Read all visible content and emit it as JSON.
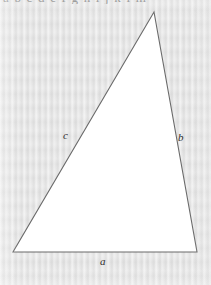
{
  "figure": {
    "kind": "geometry-diagram",
    "caption_fragment_top": "a b c d e f g h i j k l m",
    "background_color": "#e7e7e7",
    "shape_fill": "#ffffff",
    "stroke_color": "#6a6a6a",
    "label_color": "#2e2e2e"
  },
  "labels": {
    "side_a": "a",
    "side_b": "b",
    "side_c": "c"
  },
  "chart_data": {
    "type": "scatter",
    "title": "",
    "xlabel": "",
    "ylabel": "",
    "grid": false,
    "legend": "none",
    "xlim": [
      0,
      211
    ],
    "ylim": [
      285,
      0
    ],
    "annotations": [
      {
        "text": "c",
        "x": 70,
        "y": 136
      },
      {
        "text": "b",
        "x": 182,
        "y": 138
      },
      {
        "text": "a",
        "x": 103,
        "y": 262
      }
    ],
    "series": [
      {
        "name": "triangle-vertices",
        "points": [
          {
            "name": "apex",
            "x": 154,
            "y": 12
          },
          {
            "name": "bottom-left",
            "x": 13,
            "y": 252
          },
          {
            "name": "bottom-right",
            "x": 197,
            "y": 252
          }
        ]
      }
    ],
    "edges": [
      {
        "name": "side_a",
        "from": "bottom-left",
        "to": "bottom-right",
        "label": "a"
      },
      {
        "name": "side_b",
        "from": "apex",
        "to": "bottom-right",
        "label": "b"
      },
      {
        "name": "side_c",
        "from": "bottom-left",
        "to": "apex",
        "label": "c"
      }
    ]
  }
}
